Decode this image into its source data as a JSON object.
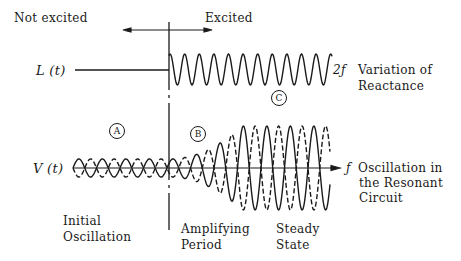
{
  "labels": {
    "not_excited": "Not excited",
    "excited": "Excited",
    "L_signal": "L (t)",
    "V_signal": "V (t)",
    "reactance_freq": "2ƒ",
    "reactance_line1": "Variation of",
    "reactance_line2": "Reactance",
    "osc_freq": "ƒ",
    "osc_line1": "Oscillation in",
    "osc_line2": "the Resonant",
    "osc_line3": "Circuit",
    "initial_line1": "Initial",
    "initial_line2": "Oscillation",
    "amplifying_line1": "Amplifying",
    "amplifying_line2": "Period",
    "steady_line1": "Steady",
    "steady_line2": "State"
  },
  "markers": {
    "A": "A",
    "B": "B",
    "C": "C"
  },
  "colors": {
    "ink": "#1a1a1a",
    "background": "#ffffff"
  }
}
